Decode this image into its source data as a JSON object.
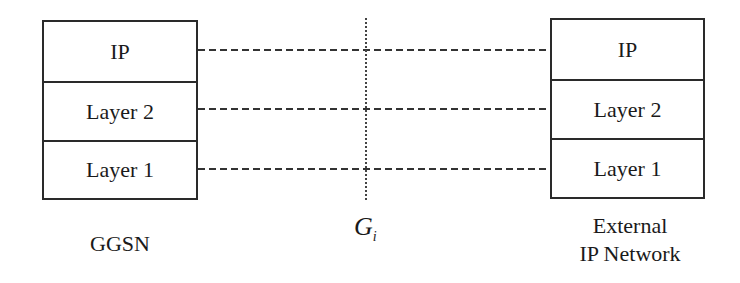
{
  "diagram": {
    "left_stack": {
      "name": "GGSN",
      "layers": [
        {
          "label": "IP"
        },
        {
          "label": "Layer 2"
        },
        {
          "label": "Layer 1"
        }
      ]
    },
    "right_stack": {
      "name_line1": "External",
      "name_line2": "IP Network",
      "layers": [
        {
          "label": "IP"
        },
        {
          "label": "Layer 2"
        },
        {
          "label": "Layer 1"
        }
      ]
    },
    "interface": {
      "symbol": "G",
      "subscript": "i"
    },
    "connections": [
      {
        "from": "GGSN.IP",
        "to": "External IP Network.IP",
        "style": "dashed"
      },
      {
        "from": "GGSN.Layer 2",
        "to": "External IP Network.Layer 2",
        "style": "dashed"
      },
      {
        "from": "GGSN.Layer 1",
        "to": "External IP Network.Layer 1",
        "style": "dashed"
      }
    ],
    "colors": {
      "line": "#2a2a2a",
      "background": "#ffffff",
      "text": "#1a1a1a"
    }
  }
}
